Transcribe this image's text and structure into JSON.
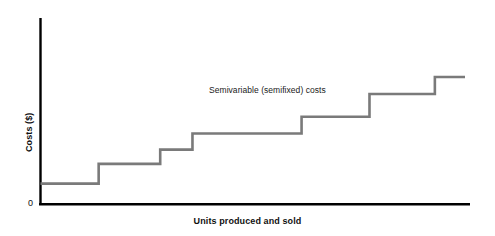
{
  "chart_data": {
    "type": "line",
    "subtype": "step",
    "title": "",
    "subtitle": "",
    "xlabel": "Units produced and sold",
    "ylabel": "Costs ($)",
    "grid": false,
    "legend_position": "none",
    "annotations": [
      {
        "text": "Semivariable (semifixed) costs",
        "x": 4.4,
        "y": 7.3
      }
    ],
    "xlim": [
      0,
      10
    ],
    "ylim": [
      0,
      10
    ],
    "xticks": [],
    "xticklabels": [],
    "yticks": [
      0
    ],
    "yticklabels": [
      "0"
    ],
    "series": [
      {
        "name": "Semivariable (semifixed) costs",
        "color": "#7a7a7a",
        "step_mode": "post",
        "x": [
          0,
          1.37,
          1.37,
          2.82,
          2.82,
          3.58,
          3.58,
          6.15,
          6.15,
          7.75,
          7.75,
          9.29,
          9.29,
          10.0
        ],
        "y": [
          1.17,
          1.17,
          2.29,
          2.29,
          3.1,
          3.1,
          4.01,
          4.01,
          4.96,
          4.96,
          6.25,
          6.25,
          7.22,
          7.22
        ],
        "steps": [
          {
            "index": 1,
            "x_start": 0.0,
            "x_end": 1.37,
            "value": 1.17
          },
          {
            "index": 2,
            "x_start": 1.37,
            "x_end": 2.82,
            "value": 2.29
          },
          {
            "index": 3,
            "x_start": 2.82,
            "x_end": 3.58,
            "value": 3.1
          },
          {
            "index": 4,
            "x_start": 3.58,
            "x_end": 6.15,
            "value": 4.01
          },
          {
            "index": 5,
            "x_start": 6.15,
            "x_end": 7.75,
            "value": 4.96
          },
          {
            "index": 6,
            "x_start": 7.75,
            "x_end": 9.29,
            "value": 6.25
          },
          {
            "index": 7,
            "x_start": 9.29,
            "x_end": 10.0,
            "value": 7.22
          }
        ]
      }
    ]
  },
  "axes": {
    "x_title": "Units produced and sold",
    "y_title": "Costs ($)",
    "y_origin_label": "0"
  },
  "annotation": {
    "label": "Semivariable (semifixed) costs"
  },
  "colors": {
    "series_line": "#7a7a7a",
    "axis_line": "#000000",
    "text": "#111111",
    "background": "#ffffff"
  }
}
